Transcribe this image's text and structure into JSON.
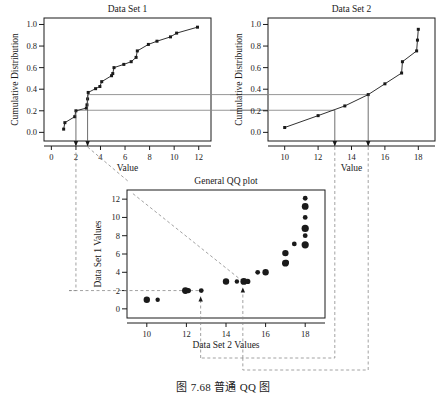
{
  "figure": {
    "caption": "图 7.68   普通 QQ 图",
    "background": "#ffffff",
    "ink": "#1a1a1a",
    "guide_color": "#8a8a8a"
  },
  "chart_data": [
    {
      "id": "data-set-1",
      "type": "line",
      "title": "Data Set 1",
      "xlabel": "Value",
      "ylabel": "Cumulative Distribution",
      "xlim": [
        -0.6,
        13.0
      ],
      "ylim": [
        -0.08,
        1.06
      ],
      "xticks": [
        0,
        2,
        4,
        6,
        8,
        10,
        12
      ],
      "xtick_labels": [
        "0",
        "2",
        "4",
        "6",
        "8",
        "10",
        "12"
      ],
      "yticks": [
        0.0,
        0.2,
        0.4,
        0.6,
        0.8,
        1.0
      ],
      "ytick_labels": [
        "0.0",
        "0.2",
        "0.4",
        "0.6",
        "0.8",
        "1.0"
      ],
      "grid": false,
      "markers": "filled-square",
      "x": [
        1.0,
        1.1,
        1.9,
        2.0,
        2.85,
        2.9,
        2.95,
        3.0,
        3.6,
        3.95,
        4.1,
        4.9,
        5.0,
        5.1,
        5.9,
        6.5,
        6.9,
        7.0,
        7.9,
        8.6,
        9.7,
        10.2,
        11.9
      ],
      "y": [
        0.03,
        0.09,
        0.145,
        0.2,
        0.225,
        0.255,
        0.31,
        0.37,
        0.405,
        0.425,
        0.47,
        0.525,
        0.545,
        0.6,
        0.63,
        0.655,
        0.695,
        0.755,
        0.815,
        0.845,
        0.885,
        0.92,
        0.975
      ],
      "annotations": {
        "horizontal_guides": [
          0.35,
          0.205
        ],
        "vertical_drops": [
          {
            "x": 2.0,
            "y": 0.2,
            "label": "2"
          },
          {
            "x": 2.95,
            "y": 0.35,
            "label": "3"
          }
        ]
      }
    },
    {
      "id": "data-set-2",
      "type": "line",
      "title": "Data Set 2",
      "xlabel": "Value",
      "ylabel": "Cumulative Distribution",
      "xlim": [
        9.0,
        19.0
      ],
      "ylim": [
        -0.08,
        1.06
      ],
      "xticks": [
        10,
        12,
        14,
        16,
        18
      ],
      "xtick_labels": [
        "10",
        "12",
        "14",
        "16",
        "18"
      ],
      "yticks": [
        0.0,
        0.2,
        0.4,
        0.6,
        0.8,
        1.0
      ],
      "ytick_labels": [
        "0.0",
        "0.2",
        "0.4",
        "0.6",
        "0.8",
        "1.0"
      ],
      "grid": false,
      "markers": "filled-square",
      "x": [
        10.0,
        12.0,
        13.6,
        15.0,
        16.0,
        17.0,
        17.05,
        17.9,
        17.95,
        18.0
      ],
      "y": [
        0.045,
        0.155,
        0.245,
        0.35,
        0.45,
        0.55,
        0.655,
        0.755,
        0.855,
        0.955
      ],
      "annotations": {
        "horizontal_guides": [
          0.35,
          0.205
        ],
        "vertical_drops": [
          {
            "x": 13.0,
            "y": 0.205,
            "label": "13"
          },
          {
            "x": 15.0,
            "y": 0.35,
            "label": "15"
          }
        ]
      }
    },
    {
      "id": "general-qq-plot",
      "type": "scatter",
      "title": "General QQ plot",
      "xlabel": "Data Set 2 Values",
      "ylabel": "Data Set 1 Values",
      "xlim": [
        9.0,
        19.0
      ],
      "ylim": [
        -1.0,
        13.0
      ],
      "xticks": [
        10,
        12,
        14,
        16,
        18
      ],
      "xtick_labels": [
        "10",
        "12",
        "14",
        "16",
        "18"
      ],
      "yticks": [
        0,
        2,
        4,
        6,
        8,
        10,
        12
      ],
      "ytick_labels": [
        "0",
        "2",
        "4",
        "6",
        "8",
        "10",
        "12"
      ],
      "grid": false,
      "markers": "filled-circle",
      "points": [
        {
          "x": 10.0,
          "y": 1.0,
          "size": 3.2
        },
        {
          "x": 10.55,
          "y": 1.0,
          "size": 2.2
        },
        {
          "x": 11.95,
          "y": 2.0,
          "size": 3.4
        },
        {
          "x": 12.1,
          "y": 2.0,
          "size": 2.6
        },
        {
          "x": 12.75,
          "y": 2.0,
          "size": 2.4
        },
        {
          "x": 14.0,
          "y": 3.0,
          "size": 3.2
        },
        {
          "x": 14.55,
          "y": 3.0,
          "size": 2.2
        },
        {
          "x": 14.9,
          "y": 3.0,
          "size": 3.4
        },
        {
          "x": 15.1,
          "y": 3.0,
          "size": 2.6
        },
        {
          "x": 15.6,
          "y": 4.0,
          "size": 2.4
        },
        {
          "x": 16.0,
          "y": 4.0,
          "size": 3.2
        },
        {
          "x": 17.0,
          "y": 5.0,
          "size": 3.4
        },
        {
          "x": 17.05,
          "y": 5.1,
          "size": 2.6
        },
        {
          "x": 17.0,
          "y": 6.1,
          "size": 3.2
        },
        {
          "x": 17.45,
          "y": 7.1,
          "size": 2.4
        },
        {
          "x": 18.0,
          "y": 7.0,
          "size": 3.6
        },
        {
          "x": 18.0,
          "y": 8.0,
          "size": 2.4
        },
        {
          "x": 18.0,
          "y": 8.8,
          "size": 3.6
        },
        {
          "x": 18.0,
          "y": 10.0,
          "size": 2.4
        },
        {
          "x": 18.0,
          "y": 11.2,
          "size": 3.4
        },
        {
          "x": 18.0,
          "y": 12.1,
          "size": 2.4
        }
      ],
      "annotations": {
        "horizontal_guide_y": 2.0,
        "diagonal_guide": {
          "from": [
            9.3,
            12.6
          ],
          "to": [
            14.85,
            3.0
          ]
        },
        "arrows": [
          {
            "x": 12.72,
            "to_y": 2.0,
            "label": "from Data Set 2 = 13"
          },
          {
            "x": 14.85,
            "to_y": 3.0,
            "label": "from Data Set 2 = 15"
          }
        ]
      }
    }
  ],
  "connectors": {
    "guide_levels": [
      "0.35",
      "0.205"
    ],
    "drop_values_set1": [
      "2",
      "3"
    ],
    "drop_values_set2": [
      "13",
      "15"
    ]
  }
}
